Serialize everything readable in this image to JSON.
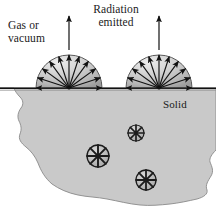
{
  "figure": {
    "type": "physics-diagram",
    "width": 216,
    "height": 216,
    "background_color": "#ffffff"
  },
  "labels": {
    "gas_or_vacuum": "Gas or\nvacuum",
    "radiation_emitted": "Radiation\nemitted",
    "solid": "Solid"
  },
  "colors": {
    "solid_fill": "#c9c9c9",
    "solid_stroke": "#6e6e6e",
    "dome_light": "#e6e6e6",
    "dome_mid": "#c4c4c4",
    "dome_dark": "#9a9a9a",
    "dome_stroke": "#4a4a4a",
    "arrow": "#111111",
    "surface_line": "#111111",
    "text": "#1a1a1a",
    "wheel_fill": "#b8b8b8",
    "wheel_stroke": "#1c1c1c"
  },
  "geometry": {
    "surface_y": 88,
    "solid_top": 88,
    "canvas": [
      216,
      216
    ]
  },
  "domes": [
    {
      "name": "left-dome",
      "cx": 69,
      "cy": 88,
      "r": 33,
      "ray_count": 11
    },
    {
      "name": "right-dome",
      "cx": 159,
      "cy": 88,
      "r": 33,
      "ray_count": 11
    }
  ],
  "ray_angles_deg": [
    0,
    18,
    36,
    54,
    72,
    90,
    108,
    126,
    144,
    162,
    180
  ],
  "vertical_arrows": [
    {
      "name": "left-emission-arrow",
      "x": 69,
      "y_top": 16,
      "y_bottom": 50
    },
    {
      "name": "right-emission-arrow",
      "x": 159,
      "y_top": 16,
      "y_bottom": 50
    }
  ],
  "internal_emitters": [
    {
      "name": "emitter-1",
      "cx": 98,
      "cy": 156,
      "r": 11,
      "spokes": 8
    },
    {
      "name": "emitter-2",
      "cx": 136,
      "cy": 133,
      "r": 8,
      "spokes": 8
    },
    {
      "name": "emitter-3",
      "cx": 146,
      "cy": 180,
      "r": 10,
      "spokes": 8
    }
  ],
  "solid_outline_path": "M 0 88 L 216 88 L 216 150 L 210 158 L 214 168 L 208 178 L 212 188 L 204 196 L 192 200 L 178 203 L 164 205 L 150 206 L 136 205 L 122 202 L 108 199 L 94 197 L 80 196 L 68 193 L 58 188 L 50 181 L 44 173 L 40 164 L 36 156 L 30 150 L 24 146 L 20 140 L 22 132 L 19 124 L 22 116 L 18 108 L 21 100 L 17 93 L 14 88 Z"
}
